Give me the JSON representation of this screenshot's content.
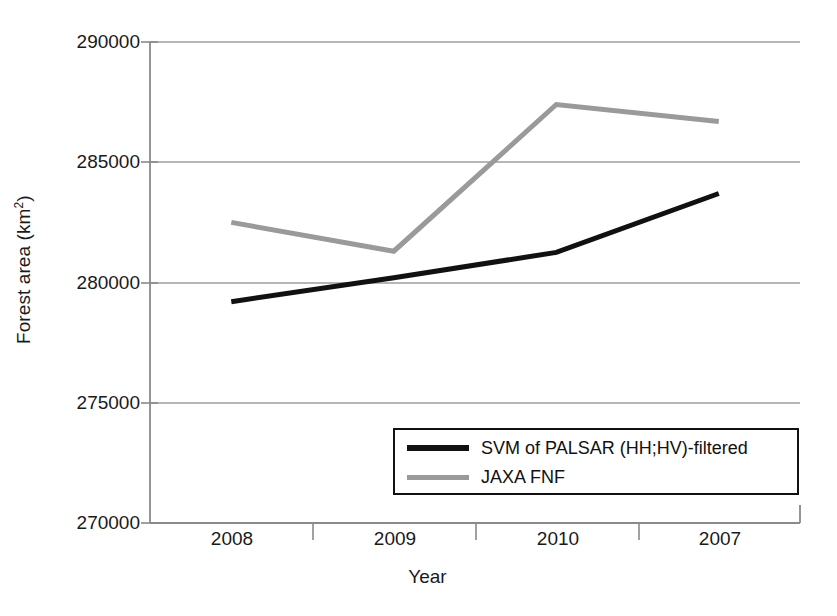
{
  "chart_data": {
    "type": "line",
    "title": "",
    "xlabel": "Year",
    "ylabel": "Forest area (km2)",
    "ylabel_display": "Forest area (km",
    "ylabel_sup": "2",
    "ylabel_tail": ")",
    "categories": [
      "2008",
      "2009",
      "2010",
      "2007"
    ],
    "x_tick_labels": [
      "2008",
      "2009",
      "2010",
      "2007"
    ],
    "y_tick_labels": [
      "290000",
      "285000",
      "280000",
      "275000",
      "270000"
    ],
    "y_tick_values": [
      290000,
      285000,
      280000,
      275000,
      270000
    ],
    "ylim": [
      270000,
      290000
    ],
    "grid": true,
    "grid_axis": "y",
    "legend_position": "inside-bottom-right",
    "series": [
      {
        "name": "SVM of PALSAR (HH;HV)-filtered",
        "color": "#111111",
        "width": 5,
        "values": [
          279200,
          280200,
          281250,
          283700
        ]
      },
      {
        "name": "JAXA FNF",
        "color": "#9a9a9a",
        "width": 5,
        "values": [
          282500,
          281300,
          287400,
          286700
        ]
      }
    ]
  },
  "legend": {
    "items": [
      {
        "label": "SVM of PALSAR (HH;HV)-filtered",
        "color": "#111111"
      },
      {
        "label": "JAXA FNF",
        "color": "#9a9a9a"
      }
    ]
  },
  "axes": {
    "x_title": "Year",
    "y_title_main": "Forest area (km",
    "y_title_sup": "2",
    "y_title_tail": ")"
  },
  "colors": {
    "series_primary": "#111111",
    "series_secondary": "#9a9a9a",
    "axis": "#808080",
    "grid": "#9e9e9e",
    "background": "#ffffff"
  }
}
